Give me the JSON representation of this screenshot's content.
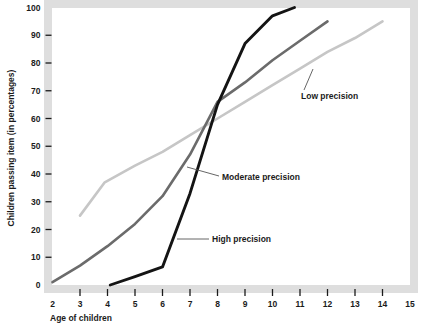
{
  "chart_data": {
    "type": "line",
    "title": "",
    "subtitle": "",
    "xlabel": "Age of children",
    "ylabel": "Children passing item (in percentages)",
    "xlim": [
      2,
      15
    ],
    "ylim": [
      0,
      100
    ],
    "xticks": [
      2,
      3,
      4,
      5,
      6,
      7,
      8,
      9,
      10,
      11,
      12,
      13,
      14,
      15
    ],
    "xtick_labels": [
      "2",
      "3",
      "4",
      "5",
      "6",
      "7",
      "8",
      "9",
      "10",
      "11",
      "12",
      "13",
      "14",
      "15"
    ],
    "yticks": [
      0,
      10,
      20,
      30,
      40,
      50,
      60,
      70,
      80,
      90,
      100
    ],
    "ytick_labels": [
      "0",
      "10",
      "20",
      "30",
      "40",
      "50",
      "60",
      "70",
      "80",
      "90",
      "100"
    ],
    "grid": false,
    "legend_position": "inline-annotations",
    "series": [
      {
        "name": "Low precision",
        "color": "#c6c6c6",
        "width": 2.6,
        "x": [
          3,
          3.9,
          5,
          6,
          7,
          8,
          9,
          10,
          11,
          12,
          13,
          14
        ],
        "values": [
          25,
          37,
          43,
          48,
          54,
          60,
          66,
          72,
          78,
          84,
          89,
          95
        ]
      },
      {
        "name": "Moderate precision",
        "color": "#6b6b6b",
        "width": 2.6,
        "x": [
          2,
          3,
          4,
          5,
          6,
          7,
          8,
          9,
          10,
          11,
          12
        ],
        "values": [
          1,
          7,
          14,
          22,
          32,
          47,
          66,
          73,
          81,
          88,
          95
        ]
      },
      {
        "name": "High precision",
        "color": "#141414",
        "width": 2.9,
        "x": [
          4.1,
          5,
          6,
          7,
          8,
          9,
          10,
          10.8
        ],
        "values": [
          0,
          3,
          6.5,
          33,
          65,
          87,
          97,
          100
        ]
      }
    ],
    "annotations": [
      {
        "text": "Low precision",
        "label_x": 301,
        "label_y": 99,
        "leader_from_x": 304,
        "leader_from_y": 90,
        "leader_to_x": 313,
        "leader_to_y": 69
      },
      {
        "text": "Moderate precision",
        "label_x": 222,
        "label_y": 180,
        "leader_from_x": 219,
        "leader_from_y": 176,
        "leader_to_x": 187,
        "leader_to_y": 167
      },
      {
        "text": "High precision",
        "label_x": 212,
        "label_y": 242,
        "leader_from_x": 209,
        "leader_from_y": 239,
        "leader_to_x": 177,
        "leader_to_y": 239
      }
    ]
  },
  "colors": {
    "frame": "#dedede",
    "background": "#ffffff",
    "text": "#1b1b1b",
    "low_precision": "#c6c6c6",
    "moderate_precision": "#6b6b6b",
    "high_precision": "#141414",
    "leader_line": "#555555"
  }
}
